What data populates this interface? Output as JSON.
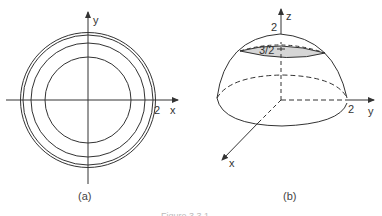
{
  "figure_a": {
    "caption": "(a)",
    "x_axis_label": "x",
    "y_axis_label": "y",
    "tick_label": "2",
    "circles_radii_px": [
      42,
      56,
      66,
      68
    ],
    "stroke_color": "#333333"
  },
  "figure_b": {
    "caption": "(b)",
    "x_axis_label": "x",
    "y_axis_label": "y",
    "z_axis_label": "z",
    "top_label": "2",
    "cap_label": "3/2",
    "y_tick_label": "2",
    "cap_fill": "#d6d6d6"
  },
  "figure_caption": "Figure 3.3.1"
}
